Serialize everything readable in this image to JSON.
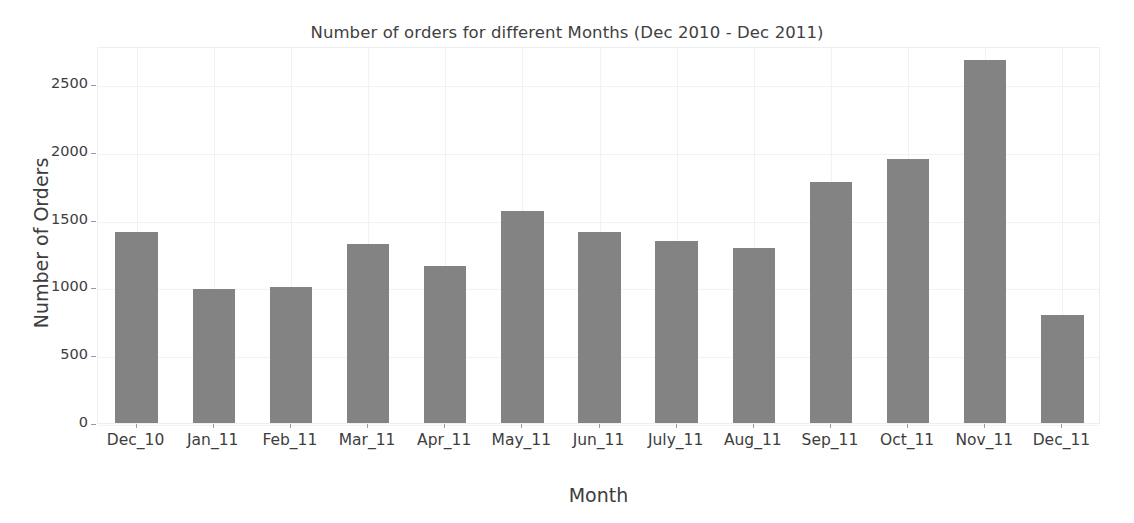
{
  "chart_data": {
    "type": "bar",
    "title": "Number of orders for different Months (Dec 2010 - Dec 2011)",
    "xlabel": "Month",
    "ylabel": "Number of Orders",
    "categories": [
      "Dec_10",
      "Jan_11",
      "Feb_11",
      "Mar_11",
      "Apr_11",
      "May_11",
      "Jun_11",
      "July_11",
      "Aug_11",
      "Sep_11",
      "Oct_11",
      "Nov_11",
      "Dec_11"
    ],
    "values": [
      1405,
      990,
      1005,
      1320,
      1155,
      1560,
      1405,
      1340,
      1290,
      1775,
      1950,
      2675,
      800
    ],
    "ylim": [
      0,
      2780
    ],
    "yticks": [
      0,
      500,
      1000,
      1500,
      2000,
      2500
    ],
    "ytick_labels": [
      "0",
      "500",
      "1000",
      "1500",
      "2000",
      "2500"
    ],
    "grid": true,
    "legend": null,
    "bar_color": "#838383",
    "grid_color": "#f0f2f4",
    "plot_background": "#ffffff",
    "text_color": "#3d3d3d"
  }
}
